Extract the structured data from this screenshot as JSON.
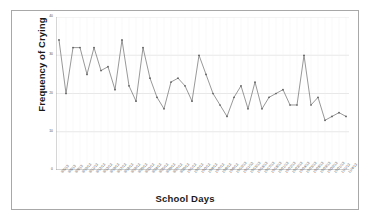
{
  "chart_data": {
    "type": "line",
    "title": "",
    "xlabel": "School Days",
    "ylabel": "Frequency of Crying",
    "ylim": [
      0,
      40
    ],
    "yticks": [
      0,
      10,
      20,
      30,
      40
    ],
    "ytick_labels": [
      "0",
      "10",
      "20",
      "30",
      "40"
    ],
    "grid": true,
    "legend": false,
    "legend_position": "none",
    "line_color": "#6b6b6b",
    "marker_color": "#5a5a5a",
    "plot_background": "#ffffff",
    "grid_color": "#d9d9d9",
    "categories": [
      "9/5/13",
      "9/6/13",
      "9/9/13",
      "9/10/13",
      "9/11/13",
      "9/12/13",
      "9/13/13",
      "9/16/13",
      "9/17/13",
      "9/18/13",
      "9/19/13",
      "9/20/13",
      "9/23/13",
      "9/24/13",
      "9/25/13",
      "9/26/13",
      "9/27/13",
      "9/30/13",
      "10/1/13",
      "10/2/13",
      "10/3/13",
      "10/4/13",
      "10/7/13",
      "10/8/13",
      "10/9/13",
      "10/10/13",
      "10/11/13",
      "10/15/13",
      "10/16/13",
      "10/17/13",
      "10/18/13",
      "10/21/13",
      "10/22/13",
      "10/23/13",
      "10/24/13",
      "10/25/13",
      "10/28/13",
      "10/29/13",
      "10/30/13",
      "10/31/13",
      "11/1/13",
      "11/4/13"
    ],
    "series": [
      {
        "name": "Frequency of Crying",
        "values": [
          34,
          20,
          32,
          32,
          25,
          32,
          26,
          27,
          21,
          34,
          22,
          18,
          32,
          24,
          19,
          16,
          23,
          24,
          22,
          18,
          30,
          25,
          20,
          17,
          14,
          19,
          22,
          16,
          23,
          16,
          19,
          20,
          21,
          17,
          17,
          30,
          17,
          19,
          13,
          14,
          15,
          14
        ]
      }
    ]
  }
}
